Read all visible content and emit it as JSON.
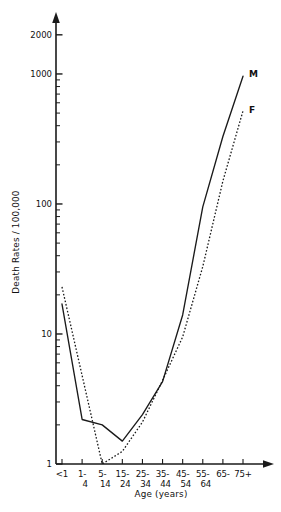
{
  "figure": {
    "background_color": "#ffffff",
    "ink_color": "#111111"
  },
  "chart_data": {
    "type": "line",
    "title": "",
    "subtitle": "",
    "xlabel": "Age (years)",
    "ylabel": "Death Rates / 100,000",
    "yscale": "log",
    "ylim": [
      1,
      2600
    ],
    "grid": false,
    "legend_position": "line-end-labels",
    "categories": [
      "<1",
      "1-4",
      "5-14",
      "15-24",
      "25-34",
      "35-44",
      "45-54",
      "55-64",
      "65-74",
      "75+"
    ],
    "category_labels_top": [
      "<1",
      "1-",
      "5-",
      "15-",
      "25-",
      "35-",
      "45-",
      "55-",
      "65-",
      "75+"
    ],
    "category_labels_bottom": [
      "",
      "4",
      "14",
      "24",
      "34",
      "44",
      "54",
      "64",
      "",
      ""
    ],
    "y_ticks": [
      1,
      10,
      100,
      1000,
      2000
    ],
    "y_tick_labels": [
      "1",
      "10",
      "100",
      "1000",
      "2000"
    ],
    "series": [
      {
        "name": "M",
        "label": "M",
        "style": "solid",
        "values": [
          17,
          2.2,
          2.0,
          1.5,
          2.4,
          4.3,
          14,
          95,
          330,
          960
        ]
      },
      {
        "name": "F",
        "label": "F",
        "style": "dashed",
        "values": [
          23,
          null,
          1.0,
          1.25,
          2.1,
          4.4,
          9.5,
          33,
          150,
          520
        ]
      }
    ],
    "annotations": [
      {
        "text": "M",
        "series": "M",
        "position": "end"
      },
      {
        "text": "F",
        "series": "F",
        "position": "end"
      }
    ]
  }
}
